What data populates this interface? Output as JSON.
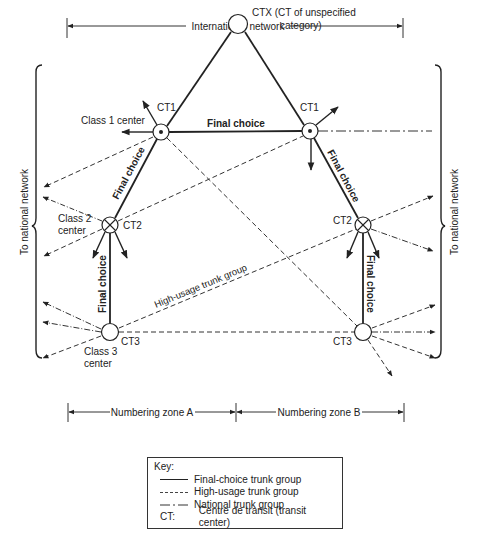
{
  "top_span": {
    "label": "International network"
  },
  "side_labels": {
    "left": "To national network",
    "right": "To national network"
  },
  "nodes": {
    "ctx": {
      "id": "CTX",
      "label": "CTX (CT of unspecified",
      "label2": "category)"
    },
    "ct1_left": {
      "id": "CT1",
      "label": "CT1",
      "class_label": "Class 1 center"
    },
    "ct1_right": {
      "id": "CT1",
      "label": "CT1"
    },
    "ct2_left": {
      "id": "CT2",
      "label": "CT2",
      "class_label": "Class 2",
      "class_label2": "center"
    },
    "ct2_right": {
      "id": "CT2",
      "label": "CT2"
    },
    "ct3_left": {
      "id": "CT3",
      "label": "CT3",
      "class_label": "Class 3",
      "class_label2": "center"
    },
    "ct3_right": {
      "id": "CT3",
      "label": "CT3"
    }
  },
  "edge_labels": {
    "ct1_ct1": "Final choice",
    "ct1l_ct2l": "Final choice",
    "ct1r_ct2r": "Final choice",
    "ct2l_ct3l": "Final choice",
    "ct2r_ct3r": "Final choice",
    "high_usage": "High-usage trunk group"
  },
  "zones": {
    "a": "Numbering zone A",
    "b": "Numbering zone B"
  },
  "key": {
    "title": "Key:",
    "items": [
      {
        "style": "solid",
        "label": "Final-choice trunk group"
      },
      {
        "style": "dashed",
        "label": "High-usage trunk group"
      },
      {
        "style": "dash-dot",
        "label": "National trunk group"
      }
    ],
    "ct_abbr": "CT:",
    "ct_def": "Centre de transit (transit center)"
  }
}
